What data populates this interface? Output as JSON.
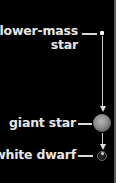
{
  "diagram": {
    "stages": [
      {
        "label_line1": "lower-mass",
        "label_line2": "star"
      },
      {
        "label": "giant star"
      },
      {
        "label": "white dwarf"
      }
    ],
    "colors": {
      "background": "#000000",
      "text": "#e6e6e6",
      "track": "#cfcfcf",
      "giant": "#9a9a9a"
    }
  }
}
